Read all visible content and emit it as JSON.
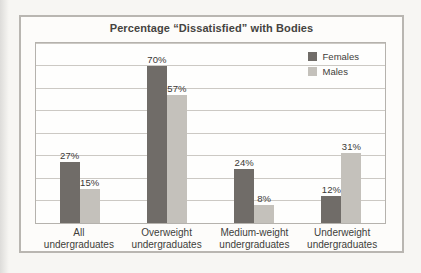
{
  "chart_data": {
    "type": "bar",
    "title": "Percentage “Dissatisfied” with Bodies",
    "categories": [
      "All undergraduates",
      "Overweight undergraduates",
      "Medium-weight undergraduates",
      "Underweight undergraduates"
    ],
    "series": [
      {
        "name": "Females",
        "color": "#706c68",
        "values": [
          27,
          70,
          24,
          12
        ]
      },
      {
        "name": "Males",
        "color": "#c4c1bb",
        "values": [
          15,
          57,
          8,
          31
        ]
      }
    ],
    "value_suffix": "%",
    "ylim": [
      0,
      80
    ],
    "gridline_interval": 10,
    "grid": true,
    "legend_position": "top-right",
    "xlabel": "",
    "ylabel": ""
  },
  "colors": {
    "frame_border": "#b9b6b1",
    "plot_border": "#b5b2ad",
    "gridline": "#ccc9c4",
    "page_background": "#f7f6f3",
    "panel_background": "#fdfcfa"
  }
}
